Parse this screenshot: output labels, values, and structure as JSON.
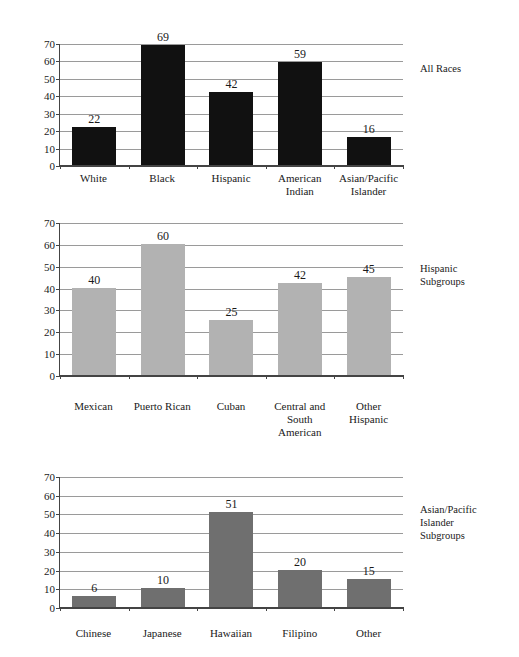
{
  "chart_data": [
    {
      "type": "bar",
      "id": "all-races",
      "title": "All Races",
      "title_lines": [
        "All Races"
      ],
      "categories": [
        "White",
        "Black",
        "Hispanic",
        "American Indian",
        "Asian/Pacific Islander"
      ],
      "category_lines": [
        [
          "White"
        ],
        [
          "Black"
        ],
        [
          "Hispanic"
        ],
        [
          "American",
          "Indian"
        ],
        [
          "Asian/Pacific",
          "Islander"
        ]
      ],
      "values": [
        22,
        69,
        42,
        59,
        16
      ],
      "bar_color": "#111111",
      "xlabel": "",
      "ylabel": "",
      "ylim": [
        0,
        70
      ],
      "ytick_step": 10,
      "yticks": [
        0,
        10,
        20,
        30,
        40,
        50,
        60,
        70
      ],
      "grid": true,
      "legend_position": "right"
    },
    {
      "type": "bar",
      "id": "hispanic-subgroups",
      "title": "Hispanic Subgroups",
      "title_lines": [
        "Hispanic",
        "Subgroups"
      ],
      "categories": [
        "Mexican",
        "Puerto Rican",
        "Cuban",
        "Central and South American",
        "Other Hispanic"
      ],
      "category_lines": [
        [
          "Mexican"
        ],
        [
          "Puerto Rican"
        ],
        [
          "Cuban"
        ],
        [
          "Central and",
          "South American"
        ],
        [
          "Other Hispanic"
        ]
      ],
      "values": [
        40,
        60,
        25,
        42,
        45
      ],
      "bar_color": "#b2b2b2",
      "xlabel": "",
      "ylabel": "",
      "ylim": [
        0,
        70
      ],
      "ytick_step": 10,
      "yticks": [
        0,
        10,
        20,
        30,
        40,
        50,
        60,
        70
      ],
      "grid": true,
      "legend_position": "right"
    },
    {
      "type": "bar",
      "id": "asian-pacific-islander-subgroups",
      "title": "Asian/Pacific Islander Subgroups",
      "title_lines": [
        "Asian/Pacific",
        "Islander",
        "Subgroups"
      ],
      "categories": [
        "Chinese",
        "Japanese",
        "Hawaiian",
        "Filipino",
        "Other"
      ],
      "category_lines": [
        [
          "Chinese"
        ],
        [
          "Japanese"
        ],
        [
          "Hawaiian"
        ],
        [
          "Filipino"
        ],
        [
          "Other"
        ]
      ],
      "values": [
        6,
        10,
        51,
        20,
        15
      ],
      "bar_color": "#6f6f6f",
      "xlabel": "",
      "ylabel": "",
      "ylim": [
        0,
        70
      ],
      "ytick_step": 10,
      "yticks": [
        0,
        10,
        20,
        30,
        40,
        50,
        60,
        70
      ],
      "grid": true,
      "legend_position": "right"
    }
  ],
  "colors": {
    "axis": "#444444",
    "gridline": "#9a9a9a",
    "text": "#1a1a1a",
    "background": "#ffffff"
  }
}
